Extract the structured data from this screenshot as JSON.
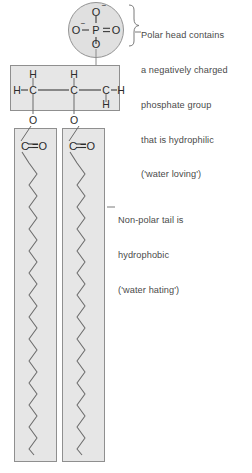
{
  "figure": {
    "background_color": "#ffffff",
    "shape_fill": "#e3e3e3",
    "shape_stroke": "#8c8c8c",
    "text_color": "#4a4a4a",
    "atom_color": "#2b2b2b"
  },
  "head": {
    "region_name": "polar-head-phosphate-group",
    "shape": "circle",
    "center_x": 96,
    "center_y": 30,
    "radius": 28,
    "atoms": {
      "top_oxygen": "O",
      "top_oxygen_charge": "−",
      "left_oxygen": "O",
      "left_oxygen_charge": "−",
      "phosphorus": "P",
      "right_oxygen": "O",
      "bottom_oxygen": "O"
    },
    "bond_labels": {
      "left": "O−P",
      "right": "P=O",
      "top": "P−O",
      "bottom": "P−O"
    },
    "annotation": {
      "line1": "Polar head contains",
      "line2": "a negatively charged",
      "line3": "phosphate group",
      "line4": "that is hydrophilic",
      "line5": "('water loving')"
    }
  },
  "glycerol": {
    "region_name": "glycerol-backbone",
    "box": {
      "x": 10,
      "y": 65,
      "width": 110,
      "height": 46
    },
    "atoms": [
      {
        "label": "H",
        "x": 33,
        "y": 75
      },
      {
        "label": "H",
        "x": 74,
        "y": 75
      },
      {
        "label": "H",
        "x": 14,
        "y": 93
      },
      {
        "label": "C",
        "x": 33,
        "y": 93
      },
      {
        "label": "C",
        "x": 74,
        "y": 93
      },
      {
        "label": "C",
        "x": 106,
        "y": 93
      },
      {
        "label": "H",
        "x": 118,
        "y": 93
      },
      {
        "label": "H",
        "x": 106,
        "y": 110
      },
      {
        "label": "O",
        "x": 33,
        "y": 121
      },
      {
        "label": "O",
        "x": 74,
        "y": 121
      }
    ]
  },
  "tails": {
    "region_name": "non-polar-fatty-acid-tails",
    "count": 2,
    "boxes": [
      {
        "name": "tail-box-left",
        "x": 14,
        "y": 128,
        "width": 43,
        "height": 334,
        "carbonyl": "C =O"
      },
      {
        "name": "tail-box-right",
        "x": 62,
        "y": 128,
        "width": 43,
        "height": 334,
        "carbonyl": "C =O"
      }
    ],
    "zigzag": {
      "period": 22,
      "amplitude": 8,
      "start_y": 152,
      "end_y": 455
    },
    "annotation": {
      "line1": "Non-polar tail is",
      "line2": "hydrophobic",
      "line3": "('water hating')"
    }
  }
}
